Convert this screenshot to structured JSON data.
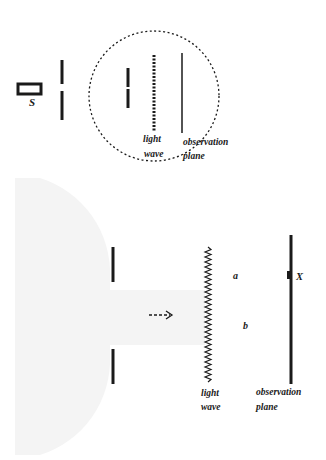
{
  "figure": {
    "top_panel": {
      "source_label": "S",
      "wave_label_line1": "light",
      "wave_label_line2": "wave",
      "plane_label_line1": "observation",
      "plane_label_line2": "plane"
    },
    "bottom_panel": {
      "point_a_label": "a",
      "point_b_label": "b",
      "marker_label": "X",
      "wave_label_line1": "light",
      "wave_label_line2": "wave",
      "plane_label_line1": "observation",
      "plane_label_line2": "plane"
    },
    "colors": {
      "ink": "#1a1a1a",
      "shade": "#f3f3f3",
      "background": "#ffffff"
    }
  }
}
